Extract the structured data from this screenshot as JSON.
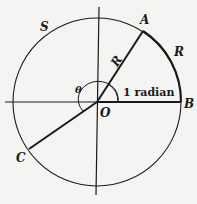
{
  "diagram": {
    "points": {
      "A": "A",
      "B": "B",
      "C": "C",
      "O": "O"
    },
    "labels": {
      "circle": "S",
      "radius": "R",
      "arc_AB": "R",
      "angle_theta": "θ",
      "angle_AOB": "1 radian"
    },
    "colors": {
      "ink": "#1a1a1a",
      "background": "#f4f4f2"
    }
  }
}
